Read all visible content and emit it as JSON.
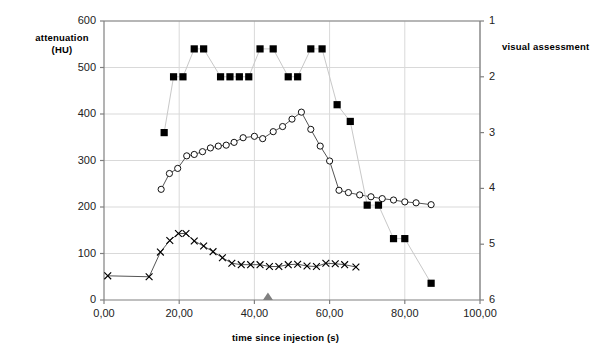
{
  "chart_data": {
    "type": "line",
    "title": "",
    "xlabel": "time since injection (s)",
    "ylabel": "attenuation (HU)",
    "ylabel_right": "visual assessment",
    "xlim": [
      0,
      100
    ],
    "ylim": [
      0,
      600
    ],
    "ylim_right": [
      1,
      6
    ],
    "y_right_inverted": true,
    "grid": true,
    "legend": "none",
    "x_ticks": [
      "0,00",
      "20,00",
      "40,00",
      "60,00",
      "80,00",
      "100,00"
    ],
    "x_tick_values": [
      0,
      20,
      40,
      60,
      80,
      100
    ],
    "y_ticks": [
      "0",
      "100",
      "200",
      "300",
      "400",
      "500",
      "600"
    ],
    "y_tick_values": [
      0,
      100,
      200,
      300,
      400,
      500,
      600
    ],
    "y_right_ticks": [
      "1",
      "2",
      "3",
      "4",
      "5",
      "6"
    ],
    "y_right_tick_values": [
      1,
      2,
      3,
      4,
      5,
      6
    ],
    "annotations": [
      {
        "name": "injection-marker",
        "type": "triangle",
        "x": 43.6,
        "y": 0,
        "color": "#808080"
      }
    ],
    "series": [
      {
        "name": "aorta attenuation",
        "marker": "circle-open",
        "axis": "left",
        "color": "#000000",
        "points": [
          [
            15.2,
            238
          ],
          [
            17.4,
            272
          ],
          [
            19.6,
            283
          ],
          [
            22.0,
            310
          ],
          [
            24.0,
            313
          ],
          [
            26.2,
            319
          ],
          [
            28.3,
            327
          ],
          [
            30.4,
            331
          ],
          [
            32.5,
            333
          ],
          [
            34.6,
            339
          ],
          [
            37.0,
            349
          ],
          [
            40.0,
            352
          ],
          [
            42.2,
            347
          ],
          [
            45.0,
            362
          ],
          [
            47.5,
            373
          ],
          [
            50.0,
            389
          ],
          [
            52.5,
            404
          ],
          [
            55.0,
            367
          ],
          [
            57.5,
            331
          ],
          [
            60.0,
            299
          ],
          [
            62.5,
            236
          ],
          [
            65.0,
            231
          ],
          [
            68.0,
            226
          ],
          [
            71.0,
            222
          ],
          [
            74.0,
            218
          ],
          [
            77.0,
            215
          ],
          [
            80.0,
            211
          ],
          [
            83.0,
            209
          ],
          [
            87.0,
            205
          ]
        ]
      },
      {
        "name": "portal vein attenuation",
        "marker": "cross",
        "axis": "left",
        "color": "#000000",
        "points": [
          [
            1.0,
            52
          ],
          [
            12.0,
            50
          ],
          [
            15.0,
            103
          ],
          [
            17.5,
            128
          ],
          [
            19.8,
            143
          ],
          [
            21.8,
            143
          ],
          [
            24.0,
            127
          ],
          [
            26.5,
            116
          ],
          [
            29.0,
            104
          ],
          [
            31.5,
            91
          ],
          [
            34.0,
            79
          ],
          [
            36.5,
            76
          ],
          [
            39.0,
            76
          ],
          [
            41.5,
            76
          ],
          [
            44.0,
            72
          ],
          [
            46.5,
            72
          ],
          [
            49.0,
            76
          ],
          [
            51.5,
            77
          ],
          [
            54.0,
            73
          ],
          [
            56.5,
            72
          ],
          [
            59.0,
            79
          ],
          [
            61.5,
            78
          ],
          [
            64.0,
            76
          ],
          [
            67.0,
            71
          ]
        ]
      },
      {
        "name": "visual assessment score",
        "marker": "square-filled",
        "axis": "right",
        "color": "#000000",
        "points": [
          [
            16.0,
            3.0
          ],
          [
            18.5,
            2.0
          ],
          [
            21.0,
            2.0
          ],
          [
            24.0,
            1.5
          ],
          [
            26.5,
            1.5
          ],
          [
            31.0,
            2.0
          ],
          [
            33.5,
            2.0
          ],
          [
            36.0,
            2.0
          ],
          [
            38.5,
            2.0
          ],
          [
            41.5,
            1.5
          ],
          [
            45.0,
            1.5
          ],
          [
            49.0,
            2.0
          ],
          [
            51.5,
            2.0
          ],
          [
            55.0,
            1.5
          ],
          [
            58.0,
            1.5
          ],
          [
            62.0,
            2.5
          ],
          [
            65.5,
            2.8
          ],
          [
            70.0,
            4.3
          ],
          [
            73.0,
            4.3
          ],
          [
            77.0,
            4.9
          ],
          [
            80.0,
            4.9
          ],
          [
            87.0,
            5.7
          ]
        ]
      }
    ]
  },
  "axis_titles": {
    "left_line1": "attenuation",
    "left_line2": "(HU)",
    "right": "visual assessment",
    "x": "time since injection (s)"
  },
  "caption": {
    "text": ""
  },
  "colors": {
    "axis": "#808080",
    "grid": "#d9d9d9",
    "series": "#000000",
    "marker_annotation": "#808080"
  }
}
